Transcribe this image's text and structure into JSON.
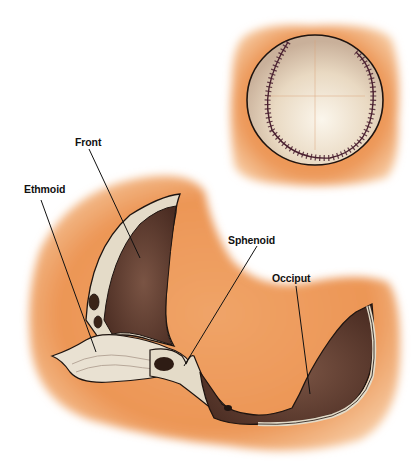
{
  "diagram": {
    "labels": [
      {
        "id": "front",
        "text": "Front"
      },
      {
        "id": "ethmoid",
        "text": "Ethmoid"
      },
      {
        "id": "sphenoid",
        "text": "Sphenoid"
      },
      {
        "id": "occiput",
        "text": "Occiput"
      }
    ],
    "colors": {
      "background": "#ffffff",
      "tissue_orange": "#ec9a5c",
      "tissue_light": "#f4bb85",
      "bone_dark": "#5a3a2e",
      "bone_light": "#e4dbc8",
      "baseball_leather": "#efe6d6",
      "stitch": "#4a2030",
      "outline": "#1e1410"
    }
  }
}
